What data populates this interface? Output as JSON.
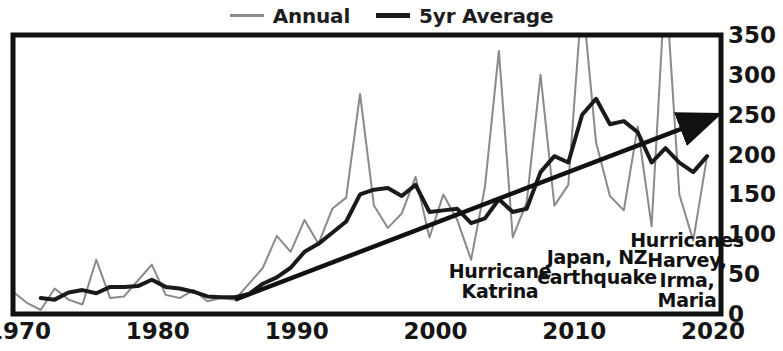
{
  "legend": {
    "position": "top-center",
    "items": [
      {
        "label": "Annual",
        "color": "#8a8a8a",
        "icon": "line-swatch"
      },
      {
        "label": "5yr Average",
        "color": "#1a1a1a",
        "icon": "line-swatch"
      }
    ]
  },
  "annotations": [
    {
      "text": "Hurricane\nKatrina",
      "x": 500,
      "y": 262
    },
    {
      "text": "Japan, NZ\nearthquake",
      "x": 597,
      "y": 248
    },
    {
      "text": "Hurricanes\nHarvey,\nIrma,\nMaria",
      "x": 687,
      "y": 231
    }
  ],
  "trend_arrow": {
    "label": "upward-trend-arrow",
    "x_start": 1986,
    "y_start": 18,
    "x_end": 2020.5,
    "y_end": 248
  },
  "chart_data": {
    "type": "line",
    "title": "",
    "xlabel": "",
    "ylabel": "",
    "xlim": [
      1970,
      2021
    ],
    "ylim": [
      0,
      350
    ],
    "yticks": [
      0,
      50,
      100,
      150,
      200,
      250,
      300,
      350
    ],
    "xticks": [
      1970,
      1980,
      1990,
      2000,
      2010,
      2020
    ],
    "grid": false,
    "clip_note": "Annual spikes in 2011 and 2017 exceed the 350 axis maximum and are clipped by the plot frame.",
    "x": [
      1970,
      1971,
      1972,
      1973,
      1974,
      1975,
      1976,
      1977,
      1978,
      1979,
      1980,
      1981,
      1982,
      1983,
      1984,
      1985,
      1986,
      1987,
      1988,
      1989,
      1990,
      1991,
      1992,
      1993,
      1994,
      1995,
      1996,
      1997,
      1998,
      1999,
      2000,
      2001,
      2002,
      2003,
      2004,
      2005,
      2006,
      2007,
      2008,
      2009,
      2010,
      2011,
      2012,
      2013,
      2014,
      2015,
      2016,
      2017,
      2018,
      2019,
      2020
    ],
    "series": [
      {
        "name": "Annual",
        "color": "#8a8a8a",
        "width": 2,
        "values": [
          28,
          14,
          5,
          32,
          18,
          12,
          68,
          20,
          22,
          42,
          62,
          24,
          20,
          30,
          16,
          20,
          18,
          38,
          58,
          98,
          78,
          118,
          88,
          132,
          146,
          276,
          136,
          108,
          126,
          172,
          96,
          150,
          118,
          68,
          160,
          330,
          96,
          140,
          300,
          136,
          162,
          400,
          215,
          148,
          130,
          235,
          110,
          420,
          150,
          92,
          198
        ]
      },
      {
        "name": "5yr Average",
        "color": "#1a1a1a",
        "width": 4,
        "values": [
          null,
          null,
          20,
          18,
          27,
          30,
          26,
          34,
          34,
          35,
          43,
          34,
          32,
          28,
          22,
          21,
          21,
          25,
          38,
          46,
          58,
          78,
          88,
          102,
          116,
          150,
          156,
          158,
          148,
          162,
          128,
          130,
          132,
          114,
          120,
          144,
          128,
          132,
          178,
          198,
          190,
          250,
          270,
          238,
          242,
          228,
          190,
          208,
          190,
          178,
          198
        ]
      }
    ]
  }
}
